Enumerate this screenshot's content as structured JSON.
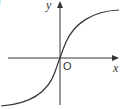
{
  "figure": {
    "axis_labels": {
      "x": "x",
      "y": "y",
      "origin": "O"
    },
    "partial_label": ")",
    "curve": "sigmoid (odd, increasing) through origin, asymptotic to horizontal lines above and below",
    "colors": {
      "axis": "#333333",
      "curve": "#333333",
      "background": "#ffffff"
    }
  }
}
